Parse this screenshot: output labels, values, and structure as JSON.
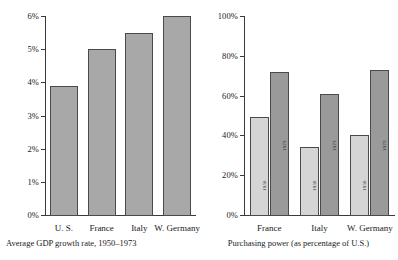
{
  "figure": {
    "panels": [
      {
        "id": "gdp-growth",
        "caption": "Average GDP growth rate, 1950–1973",
        "yticks": [
          "0%",
          "1%",
          "2%",
          "3%",
          "4%",
          "5%",
          "6%"
        ],
        "categories": [
          "U. S.",
          "France",
          "Italy",
          "W. Germany"
        ]
      },
      {
        "id": "purchasing-power",
        "caption": "Purchasing power (as percentage of U.S.)",
        "yticks": [
          "0%",
          "20%",
          "40%",
          "60%",
          "80%",
          "100%"
        ],
        "categories": [
          "France",
          "Italy",
          "W. Germany"
        ],
        "series_labels": [
          "1950",
          "1973"
        ]
      }
    ]
  },
  "chart_data": [
    {
      "type": "bar",
      "title": "",
      "caption": "Average GDP growth rate, 1950–1973",
      "xlabel": "",
      "ylabel": "",
      "categories": [
        "U. S.",
        "France",
        "Italy",
        "W. Germany"
      ],
      "values": [
        3.9,
        5.0,
        5.5,
        6.0
      ],
      "ylim": [
        0,
        6
      ],
      "ytick_values": [
        0,
        1,
        2,
        3,
        4,
        5,
        6
      ],
      "ytick_labels": [
        "0%",
        "1%",
        "2%",
        "3%",
        "4%",
        "5%",
        "6%"
      ],
      "grid": false,
      "legend": "none",
      "bar_color": "#a8a8a8",
      "bar_edge_color": "#4a4a4a"
    },
    {
      "type": "bar",
      "title": "",
      "caption": "Purchasing power (as percentage of U.S.)",
      "xlabel": "",
      "ylabel": "",
      "categories": [
        "France",
        "Italy",
        "W. Germany"
      ],
      "series": [
        {
          "name": "1950",
          "values": [
            49,
            34,
            40
          ],
          "color": "#d5d5d5"
        },
        {
          "name": "1973",
          "values": [
            72,
            61,
            73
          ],
          "color": "#9a9a9a"
        }
      ],
      "ylim": [
        0,
        100
      ],
      "ytick_values": [
        0,
        20,
        40,
        60,
        80,
        100
      ],
      "ytick_labels": [
        "0%",
        "20%",
        "40%",
        "60%",
        "80%",
        "100%"
      ],
      "grid": false,
      "legend": "in-bar-labels",
      "bar_edge_color": "#4a4a4a"
    }
  ]
}
